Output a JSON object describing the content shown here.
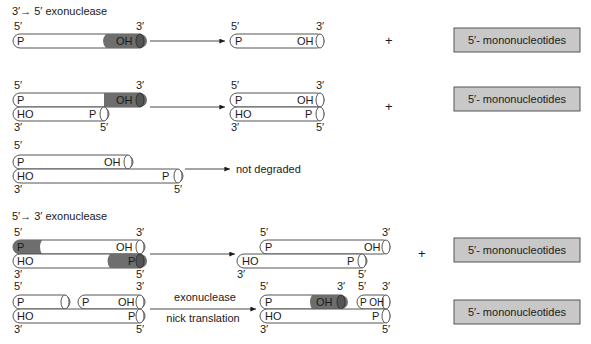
{
  "sections": {
    "exo35": {
      "title": "3′→ 5′ exonuclease",
      "arrow_glyph": "→"
    },
    "exo53": {
      "title": "5′→ 3′ exonuclease"
    }
  },
  "labels": {
    "five_prime": "5′",
    "three_prime": "3′",
    "p": "P",
    "oh": "OH",
    "ho": "HO",
    "poh": "P OH",
    "plus": "+",
    "not_degraded": "not degraded",
    "exonuclease": "exonuclease",
    "nick_translation": "nick translation"
  },
  "products": [
    {
      "label": "5′- mononucleotides"
    },
    {
      "label": "5′- mononucleotides"
    },
    {
      "label": "5′- mononucleotides"
    },
    {
      "label": "5′- mononucleotides"
    }
  ],
  "colors": {
    "strand_fill": "#ffffff",
    "strand_stroke": "#555555",
    "degraded_fill": "#6e6e6e",
    "product_box_fill": "#c8c8c8",
    "product_box_stroke": "#555555",
    "text": "#1a1a1a"
  }
}
